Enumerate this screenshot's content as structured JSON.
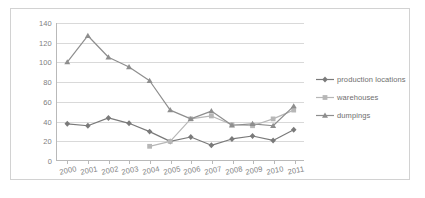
{
  "chart_data": {
    "type": "line",
    "title": "",
    "xlabel": "",
    "ylabel": "",
    "categories": [
      "2000",
      "2001",
      "2002",
      "2003",
      "2004",
      "2005",
      "2006",
      "2007",
      "2008",
      "2009",
      "2010",
      "2011"
    ],
    "ylim": [
      0,
      140
    ],
    "yticks": [
      0,
      20,
      40,
      60,
      80,
      100,
      120,
      140
    ],
    "grid": true,
    "legend_position": "right",
    "series": [
      {
        "name": "production locations",
        "color": "#7a7a7a",
        "marker": "diamond",
        "values": [
          37,
          35,
          43,
          37.5,
          29,
          19,
          23.5,
          15,
          21.5,
          24.5,
          20,
          31
        ]
      },
      {
        "name": "warehouses",
        "color": "#b7b7b7",
        "marker": "square",
        "values": [
          null,
          null,
          null,
          null,
          14,
          19,
          42,
          45,
          36,
          35,
          42,
          51
        ]
      },
      {
        "name": "dumpings",
        "color": "#8e8e8e",
        "marker": "triangle",
        "values": [
          100,
          127,
          105,
          95,
          81,
          51,
          42,
          50,
          35.5,
          37,
          35,
          55
        ]
      }
    ]
  },
  "axis": {
    "ytick_labels": [
      "140",
      "120",
      "100",
      "80",
      "60",
      "40",
      "20",
      "0"
    ],
    "xtick_labels": [
      "2000",
      "2001",
      "2002",
      "2003",
      "2004",
      "2005",
      "2006",
      "2007",
      "2008",
      "2009",
      "2010",
      "2011"
    ]
  },
  "legend": {
    "items": [
      {
        "label": "production locations"
      },
      {
        "label": "warehouses"
      },
      {
        "label": "dumpings"
      }
    ]
  },
  "colors": {
    "series_production": "#7a7a7a",
    "series_warehouses": "#b7b7b7",
    "series_dumpings": "#8e8e8e",
    "gridline": "#d9d9d9",
    "axis": "#b9b9b9",
    "frame": "#d2d2d2",
    "tick_text": "#808080",
    "legend_text": "#6e6e6e",
    "background": "#ffffff"
  }
}
